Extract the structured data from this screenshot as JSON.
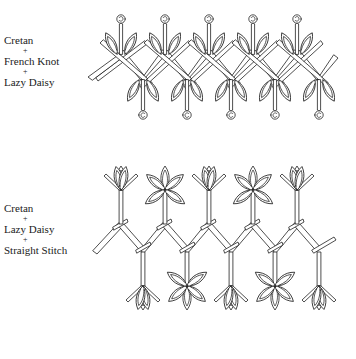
{
  "figures": [
    {
      "id": "pattern-1",
      "labels": [
        "Cretan",
        "+",
        "French Knot",
        "+",
        "Lazy Daisy"
      ]
    },
    {
      "id": "pattern-2",
      "labels": [
        "Cretan",
        "+",
        "Lazy Daisy",
        "+",
        "Straight Stitch"
      ]
    }
  ],
  "colors": {
    "stroke": "#222222",
    "fill": "#ffffff"
  }
}
